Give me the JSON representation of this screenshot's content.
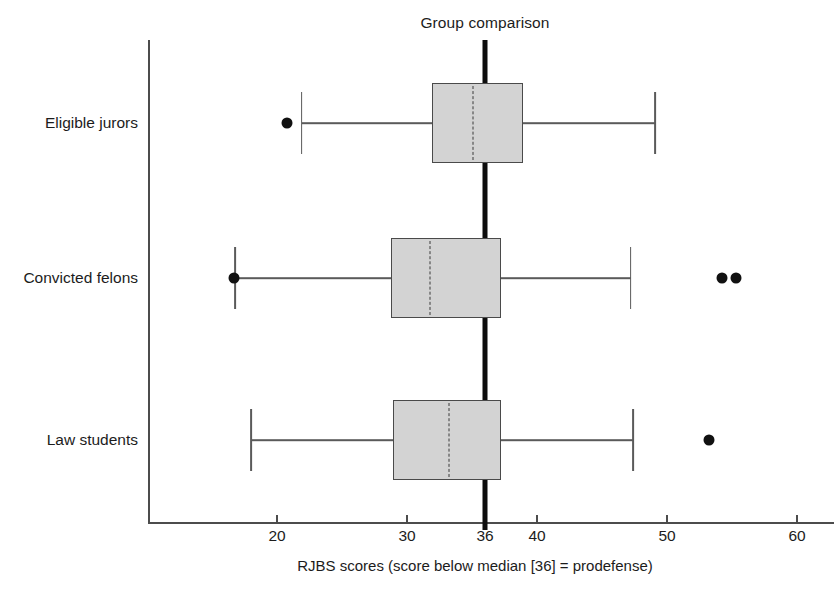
{
  "chart_data": {
    "type": "box",
    "title": "Group comparison",
    "xlabel": "RJBS scores (score below median [36] = prodefense)",
    "ylabel": "",
    "orientation": "horizontal",
    "xlim": [
      14,
      62
    ],
    "grid": false,
    "legend": "none",
    "xticks": [
      20,
      30,
      36,
      40,
      50,
      60
    ],
    "xtick_labels": [
      "20",
      "30",
      "36",
      "40",
      "50",
      "60"
    ],
    "reference_line": {
      "value": 36,
      "label": "36",
      "style": "thick-solid-black"
    },
    "categories": [
      "Eligible jurors",
      "Convicted felons",
      "Law students"
    ],
    "boxes": [
      {
        "category": "Eligible jurors",
        "whisker_low": 21.9,
        "q1": 31.9,
        "median": 35.1,
        "q3": 38.9,
        "whisker_high": 49.1,
        "outliers": [
          20.8
        ]
      },
      {
        "category": "Convicted felons",
        "whisker_low": 16.8,
        "q1": 28.8,
        "median": 31.8,
        "q3": 37.2,
        "whisker_high": 47.2,
        "outliers": [
          16.7,
          54.2,
          55.3
        ]
      },
      {
        "category": "Law students",
        "whisker_low": 18.0,
        "q1": 28.9,
        "median": 33.2,
        "q3": 37.2,
        "whisker_high": 47.4,
        "outliers": [
          53.2
        ]
      }
    ],
    "colors": {
      "box_fill": "#d3d3d3",
      "box_edge": "#4a4a4a",
      "median_line": "#3a3a3a",
      "whisker": "#5a5a5a",
      "outlier": "#111111",
      "axis": "#4c4c4c",
      "reference": "#0d0d0d",
      "background": "#ffffff",
      "text": "#1c1c1c"
    }
  }
}
